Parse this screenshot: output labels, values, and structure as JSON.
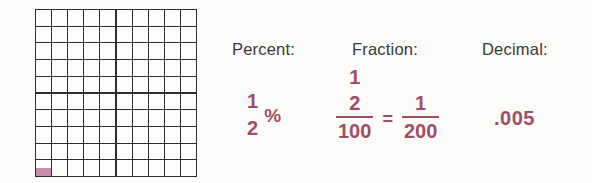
{
  "colors": {
    "background": "#fbfbf9",
    "grid_line": "#2e2e2e",
    "cell_shade": "#c48fa7",
    "label_text": "#3a3a3a",
    "value_text": "#9e4f66"
  },
  "grid": {
    "rows": 10,
    "cols": 10,
    "total_cells": 100,
    "shaded_cell": {
      "row": 10,
      "col": 1,
      "portion_shaded": "bottom-half"
    }
  },
  "percent": {
    "label": "Percent:",
    "value_numerator": "1",
    "value_denominator": "2",
    "percent_sign": "%"
  },
  "fraction": {
    "label": "Fraction:",
    "complex_numerator_top": "1",
    "complex_numerator_bottom": "2",
    "complex_denominator": "100",
    "equals_sign": "=",
    "result_numerator": "1",
    "result_denominator": "200"
  },
  "decimal": {
    "label": "Decimal:",
    "value": ".005"
  }
}
